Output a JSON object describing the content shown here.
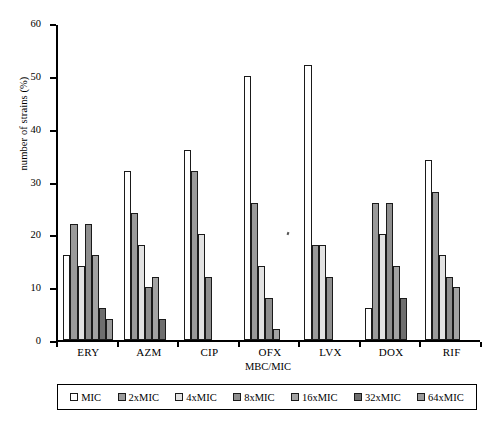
{
  "chart_data": {
    "type": "bar",
    "title": "",
    "xlabel": "MBC/MIC",
    "ylabel": "number of strains (%)",
    "ylim": [
      0,
      60
    ],
    "yticks": [
      0,
      10,
      20,
      30,
      40,
      50,
      60
    ],
    "grid": false,
    "legend_position": "bottom",
    "categories": [
      "ERY",
      "AZM",
      "CIP",
      "OFX",
      "LVX",
      "DOX",
      "RIF"
    ],
    "series": [
      {
        "name": "MIC",
        "color": "#ffffff",
        "values": [
          16,
          32,
          36,
          50,
          52,
          6,
          34
        ]
      },
      {
        "name": "2xMIC",
        "color": "#9a9a9a",
        "values": [
          22,
          24,
          32,
          26,
          18,
          26,
          28
        ]
      },
      {
        "name": "4xMIC",
        "color": "#e2e2e2",
        "values": [
          14,
          18,
          20,
          14,
          18,
          20,
          16
        ]
      },
      {
        "name": "8xMIC",
        "color": "#8e8e8e",
        "values": [
          22,
          10,
          12,
          8,
          12,
          26,
          12
        ]
      },
      {
        "name": "16xMIC",
        "color": "#a3a3a3",
        "values": [
          16,
          12,
          0,
          2,
          0,
          14,
          10
        ]
      },
      {
        "name": "32xMIC",
        "color": "#6e6e6e",
        "values": [
          6,
          4,
          0,
          0,
          0,
          8,
          0
        ]
      },
      {
        "name": "64xMIC",
        "color": "#9a9a9a",
        "values": [
          4,
          0,
          0,
          0,
          0,
          0,
          0
        ]
      }
    ]
  }
}
